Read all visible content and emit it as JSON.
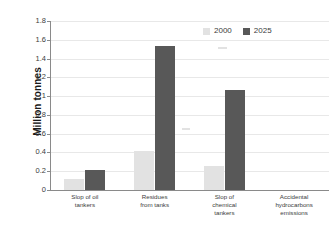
{
  "chart_data": {
    "type": "bar",
    "title": "",
    "xlabel": "",
    "ylabel": "Million tonnes",
    "ylim": [
      0,
      1.8
    ],
    "ytick_step": 0.2,
    "yticks": [
      "0",
      "0.2",
      "0.4",
      "0.6",
      "0.8",
      "1",
      "1.2",
      "1.4",
      "1.6",
      "1.8"
    ],
    "grid": true,
    "legend_position": "top-right",
    "categories": [
      "Slop of oil tankers",
      "Residues from tanks",
      "Slop of chemical tankers",
      "Accidental hydrocarbons emissions"
    ],
    "category_lines": [
      [
        "Slop of oil",
        "tankers"
      ],
      [
        "Residues",
        "from tanks"
      ],
      [
        "Slop of",
        "chemical",
        "tankers"
      ],
      [
        "Accidental",
        "hydrocarbons",
        "emissions"
      ]
    ],
    "series": [
      {
        "name": "2000",
        "color": "#e2e2e2",
        "values": [
          0.12,
          0.42,
          0.26,
          0
        ]
      },
      {
        "name": "2025",
        "color": "#585858",
        "values": [
          0.21,
          1.53,
          1.06,
          0
        ]
      }
    ]
  },
  "legend": {
    "items": [
      {
        "label": "2000",
        "color": "#e2e2e2"
      },
      {
        "label": "2025",
        "color": "#585858"
      }
    ]
  },
  "axes": {
    "y_title": "Million tonnes"
  }
}
